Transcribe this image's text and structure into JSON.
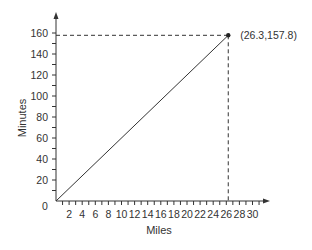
{
  "chart_data": {
    "type": "line",
    "title": "",
    "xlabel": "Miles",
    "ylabel": "Minutes",
    "xlim": [
      0,
      32
    ],
    "ylim": [
      0,
      170
    ],
    "origin_label": "0",
    "x_ticks": [
      "2",
      "4",
      "6",
      "8",
      "10",
      "12",
      "14",
      "16",
      "18",
      "20",
      "22",
      "24",
      "26",
      "28",
      "30"
    ],
    "y_ticks": [
      "20",
      "40",
      "60",
      "80",
      "100",
      "120",
      "140",
      "160"
    ],
    "grid": false,
    "legend": null,
    "series": [
      {
        "name": "pace",
        "x": [
          0,
          26.3
        ],
        "y": [
          0,
          157.8
        ]
      }
    ],
    "annotations": [
      {
        "text": "(26.3,157.8)",
        "x": 26.3,
        "y": 157.8,
        "marker": "dot",
        "dashed_guides": true
      }
    ]
  }
}
